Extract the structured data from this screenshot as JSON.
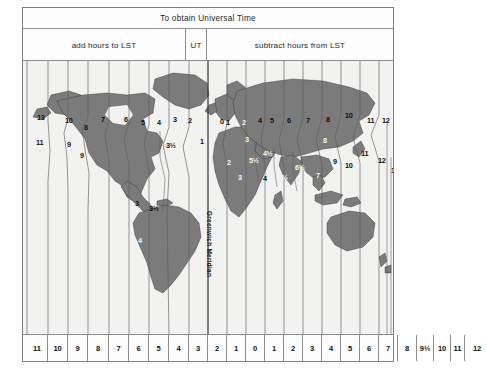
{
  "figure": {
    "header": {
      "universal_time_label": "To obtain Universal Time",
      "add_label": "add hours to LST",
      "ut_label": "UT",
      "subtract_label": "subtract hours from LST"
    },
    "meridian_label": "Greenwich Meridian",
    "dateline_label": "Date Line",
    "colors": {
      "land": "#7b7b7b",
      "ocean": "#f2f2f1",
      "paper": "#fdfdfd",
      "rule": "#8a8c8f",
      "text": "#1b1b1b"
    }
  },
  "chart_data": {
    "type": "map",
    "title": "To obtain Universal Time",
    "xlabel": "Time zone offset (hours)",
    "ylabel": "",
    "grid": true,
    "legend": "none",
    "bottom_scale": {
      "label": "hours",
      "cells": [
        {
          "label": "11",
          "x": 4,
          "w": 21
        },
        {
          "label": "10",
          "x": 25,
          "w": 20
        },
        {
          "label": "9",
          "x": 45,
          "w": 20
        },
        {
          "label": "8",
          "x": 65,
          "w": 21
        },
        {
          "label": "7",
          "x": 86,
          "w": 20
        },
        {
          "label": "6",
          "x": 106,
          "w": 20
        },
        {
          "label": "5",
          "x": 126,
          "w": 20
        },
        {
          "label": "4",
          "x": 146,
          "w": 20
        },
        {
          "label": "3",
          "x": 166,
          "w": 19
        },
        {
          "label": "2",
          "x": 185,
          "w": 19
        },
        {
          "label": "1",
          "x": 204,
          "w": 19
        },
        {
          "label": "0",
          "x": 223,
          "w": 19
        },
        {
          "label": "1",
          "x": 242,
          "w": 19
        },
        {
          "label": "2",
          "x": 261,
          "w": 19
        },
        {
          "label": "3",
          "x": 280,
          "w": 19
        },
        {
          "label": "4",
          "x": 299,
          "w": 19
        },
        {
          "label": "5",
          "x": 318,
          "w": 19
        },
        {
          "label": "6",
          "x": 337,
          "w": 19
        },
        {
          "label": "7",
          "x": 356,
          "w": 19
        },
        {
          "label": "8",
          "x": 375,
          "w": 19
        },
        {
          "label": "9½",
          "x": 394,
          "w": 17
        },
        {
          "label": "10",
          "x": 411,
          "w": 17
        },
        {
          "label": "11",
          "x": 428,
          "w": 14
        },
        {
          "label": "12",
          "x": 442,
          "w": 24
        }
      ]
    },
    "zone_labels": [
      {
        "label": "13",
        "x": 14,
        "y": 52,
        "tone": "dark"
      },
      {
        "label": "10",
        "x": 42,
        "y": 55,
        "tone": "dark"
      },
      {
        "label": "8",
        "x": 61,
        "y": 62,
        "tone": "dark"
      },
      {
        "label": "7",
        "x": 78,
        "y": 54,
        "tone": "dark"
      },
      {
        "label": "6",
        "x": 101,
        "y": 54,
        "tone": "dark"
      },
      {
        "label": "5",
        "x": 118,
        "y": 57,
        "tone": "dark"
      },
      {
        "label": "4",
        "x": 134,
        "y": 57,
        "tone": "dark"
      },
      {
        "label": "3",
        "x": 150,
        "y": 54,
        "tone": "dark"
      },
      {
        "label": "2",
        "x": 165,
        "y": 55,
        "tone": "dark"
      },
      {
        "label": "11",
        "x": 13,
        "y": 77,
        "tone": "dark"
      },
      {
        "label": "9",
        "x": 44,
        "y": 79,
        "tone": "dark"
      },
      {
        "label": "9",
        "x": 57,
        "y": 90,
        "tone": "dark"
      },
      {
        "label": "3½",
        "x": 143,
        "y": 80,
        "tone": "dark"
      },
      {
        "label": "1",
        "x": 177,
        "y": 76,
        "tone": "dark"
      },
      {
        "label": "0",
        "x": 197,
        "y": 56,
        "tone": "dark"
      },
      {
        "label": "1",
        "x": 203,
        "y": 57,
        "tone": "dark"
      },
      {
        "label": "2",
        "x": 219,
        "y": 57,
        "tone": "light"
      },
      {
        "label": "3",
        "x": 222,
        "y": 74,
        "tone": "light"
      },
      {
        "label": "4",
        "x": 235,
        "y": 55,
        "tone": "dark"
      },
      {
        "label": "5",
        "x": 247,
        "y": 55,
        "tone": "dark"
      },
      {
        "label": "6",
        "x": 264,
        "y": 55,
        "tone": "dark"
      },
      {
        "label": "7",
        "x": 283,
        "y": 55,
        "tone": "dark"
      },
      {
        "label": "8",
        "x": 303,
        "y": 54,
        "tone": "dark"
      },
      {
        "label": "10",
        "x": 322,
        "y": 50,
        "tone": "dark"
      },
      {
        "label": "11",
        "x": 344,
        "y": 55,
        "tone": "dark"
      },
      {
        "label": "12",
        "x": 359,
        "y": 55,
        "tone": "dark"
      },
      {
        "label": "13",
        "x": 373,
        "y": 55,
        "tone": "dark"
      },
      {
        "label": "8",
        "x": 300,
        "y": 75,
        "tone": "light"
      },
      {
        "label": "11",
        "x": 338,
        "y": 88,
        "tone": "dark"
      },
      {
        "label": "9",
        "x": 310,
        "y": 96,
        "tone": "dark"
      },
      {
        "label": "10",
        "x": 322,
        "y": 100,
        "tone": "dark"
      },
      {
        "label": "12",
        "x": 355,
        "y": 95,
        "tone": "dark"
      },
      {
        "label": "12",
        "x": 368,
        "y": 105,
        "tone": "dark"
      },
      {
        "label": "2",
        "x": 204,
        "y": 97,
        "tone": "light"
      },
      {
        "label": "4½",
        "x": 240,
        "y": 88,
        "tone": "light"
      },
      {
        "label": "5½",
        "x": 226,
        "y": 95,
        "tone": "light"
      },
      {
        "label": "3",
        "x": 215,
        "y": 112,
        "tone": "light"
      },
      {
        "label": "4",
        "x": 240,
        "y": 113,
        "tone": "dark"
      },
      {
        "label": "5½",
        "x": 255,
        "y": 112,
        "tone": "light"
      },
      {
        "label": "6½",
        "x": 272,
        "y": 102,
        "tone": "light"
      },
      {
        "label": "7",
        "x": 293,
        "y": 110,
        "tone": "light"
      },
      {
        "label": "3",
        "x": 112,
        "y": 138,
        "tone": "dark"
      },
      {
        "label": "3½",
        "x": 126,
        "y": 143,
        "tone": "dark"
      },
      {
        "label": "4",
        "x": 115,
        "y": 175,
        "tone": "light"
      },
      {
        "label": "3",
        "x": 112,
        "y": 204,
        "tone": "light"
      }
    ]
  }
}
